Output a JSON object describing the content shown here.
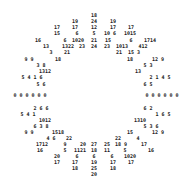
{
  "colors": {
    "text": "#222222",
    "background": "#ffffff"
  },
  "tokens": [
    {
      "t": "18",
      "x": 94,
      "y": 15
    },
    {
      "t": "19",
      "x": 75,
      "y": 21
    },
    {
      "t": "24",
      "x": 94,
      "y": 21
    },
    {
      "t": "19",
      "x": 113,
      "y": 21
    },
    {
      "t": "17",
      "x": 57,
      "y": 27
    },
    {
      "t": "17",
      "x": 75,
      "y": 27
    },
    {
      "t": "12",
      "x": 94,
      "y": 27
    },
    {
      "t": "17",
      "x": 113,
      "y": 27
    },
    {
      "t": "17",
      "x": 131,
      "y": 27
    },
    {
      "t": "15",
      "x": 57,
      "y": 33
    },
    {
      "t": "6",
      "x": 77,
      "y": 33
    },
    {
      "t": "5",
      "x": 94,
      "y": 33
    },
    {
      "t": "10 6",
      "x": 110,
      "y": 33
    },
    {
      "t": "1015",
      "x": 130,
      "y": 33
    },
    {
      "t": "16",
      "x": 38,
      "y": 40
    },
    {
      "t": "6",
      "x": 65,
      "y": 40
    },
    {
      "t": "1020",
      "x": 78,
      "y": 40
    },
    {
      "t": "21",
      "x": 94,
      "y": 40
    },
    {
      "t": "15",
      "x": 108,
      "y": 40
    },
    {
      "t": "6",
      "x": 131,
      "y": 40
    },
    {
      "t": "1714",
      "x": 150,
      "y": 40
    },
    {
      "t": "13",
      "x": 46,
      "y": 46
    },
    {
      "t": "1322",
      "x": 68,
      "y": 46
    },
    {
      "t": "23",
      "x": 82,
      "y": 46
    },
    {
      "t": "24",
      "x": 94,
      "y": 46
    },
    {
      "t": "23",
      "x": 107,
      "y": 46
    },
    {
      "t": "1013",
      "x": 122,
      "y": 46
    },
    {
      "t": "412",
      "x": 143,
      "y": 46
    },
    {
      "t": "3",
      "x": 51,
      "y": 52
    },
    {
      "t": "21",
      "x": 67,
      "y": 52
    },
    {
      "t": "21",
      "x": 119,
      "y": 52
    },
    {
      "t": "15 3",
      "x": 134,
      "y": 52
    },
    {
      "t": "9 9",
      "x": 29,
      "y": 59
    },
    {
      "t": "18",
      "x": 58,
      "y": 59
    },
    {
      "t": "18",
      "x": 130,
      "y": 59
    },
    {
      "t": "12 9",
      "x": 158,
      "y": 59
    },
    {
      "t": "3 8",
      "x": 41,
      "y": 65
    },
    {
      "t": "5 3",
      "x": 148,
      "y": 65
    },
    {
      "t": "1312",
      "x": 45,
      "y": 71
    },
    {
      "t": "13",
      "x": 138,
      "y": 71
    },
    {
      "t": "5 4 1 6",
      "x": 32,
      "y": 77
    },
    {
      "t": "2 1 4 5",
      "x": 160,
      "y": 77
    },
    {
      "t": "5 6",
      "x": 41,
      "y": 84
    },
    {
      "t": "6 5",
      "x": 148,
      "y": 84
    },
    {
      "t": "0 0 0 0 0 0",
      "x": 30,
      "y": 95
    },
    {
      "t": "0 0 0 0 0 0",
      "x": 162,
      "y": 95
    },
    {
      "t": "2 6 6",
      "x": 41,
      "y": 108
    },
    {
      "t": "6 2",
      "x": 148,
      "y": 108
    },
    {
      "t": "5 4 1",
      "x": 28,
      "y": 114
    },
    {
      "t": "1 6 5",
      "x": 163,
      "y": 114
    },
    {
      "t": "1012",
      "x": 45,
      "y": 120
    },
    {
      "t": "1310",
      "x": 140,
      "y": 120
    },
    {
      "t": "6 3 8",
      "x": 41,
      "y": 126
    },
    {
      "t": "5 3 6",
      "x": 151,
      "y": 126
    },
    {
      "t": "9 9",
      "x": 29,
      "y": 132
    },
    {
      "t": "1518",
      "x": 58,
      "y": 132
    },
    {
      "t": "15",
      "x": 130,
      "y": 132
    },
    {
      "t": "12 9",
      "x": 158,
      "y": 132
    },
    {
      "t": "4 6",
      "x": 51,
      "y": 138
    },
    {
      "t": "22",
      "x": 69,
      "y": 138
    },
    {
      "t": "22",
      "x": 118,
      "y": 138
    },
    {
      "t": "4",
      "x": 138,
      "y": 138
    },
    {
      "t": "1712",
      "x": 42,
      "y": 144
    },
    {
      "t": "9",
      "x": 65,
      "y": 144
    },
    {
      "t": "20",
      "x": 83,
      "y": 144
    },
    {
      "t": "27",
      "x": 94,
      "y": 144
    },
    {
      "t": "25",
      "x": 107,
      "y": 144
    },
    {
      "t": "18 9",
      "x": 121,
      "y": 144
    },
    {
      "t": "17",
      "x": 144,
      "y": 144
    },
    {
      "t": "16",
      "x": 40,
      "y": 150
    },
    {
      "t": "5",
      "x": 65,
      "y": 150
    },
    {
      "t": "1121",
      "x": 80,
      "y": 150
    },
    {
      "t": "18",
      "x": 94,
      "y": 150
    },
    {
      "t": "11",
      "x": 107,
      "y": 150
    },
    {
      "t": "5",
      "x": 125,
      "y": 150
    },
    {
      "t": "16",
      "x": 151,
      "y": 150
    },
    {
      "t": "20",
      "x": 57,
      "y": 156
    },
    {
      "t": "6",
      "x": 77,
      "y": 156
    },
    {
      "t": "6",
      "x": 94,
      "y": 156
    },
    {
      "t": "6",
      "x": 112,
      "y": 156
    },
    {
      "t": "1020",
      "x": 130,
      "y": 156
    },
    {
      "t": "17",
      "x": 57,
      "y": 162
    },
    {
      "t": "17",
      "x": 75,
      "y": 162
    },
    {
      "t": "19",
      "x": 94,
      "y": 162
    },
    {
      "t": "17",
      "x": 113,
      "y": 162
    },
    {
      "t": "17",
      "x": 131,
      "y": 162
    },
    {
      "t": "18",
      "x": 75,
      "y": 168
    },
    {
      "t": "25",
      "x": 94,
      "y": 168
    },
    {
      "t": "18",
      "x": 113,
      "y": 168
    },
    {
      "t": "20",
      "x": 94,
      "y": 174
    }
  ]
}
